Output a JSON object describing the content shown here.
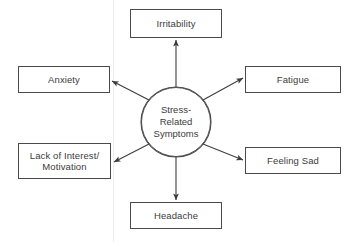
{
  "diagram": {
    "type": "radial-spoke",
    "center": {
      "id": "center",
      "label": "Stress-\nRelated\nSymptoms",
      "shape": "circle",
      "cx": 176,
      "cy": 122,
      "r": 35
    },
    "nodes": [
      {
        "id": "irritability",
        "label": "Irritability",
        "shape": "rect",
        "x": 130,
        "y": 9,
        "w": 92,
        "h": 29,
        "position": "top"
      },
      {
        "id": "fatigue",
        "label": "Fatigue",
        "shape": "rect",
        "x": 245,
        "y": 66,
        "w": 96,
        "h": 27,
        "position": "top-right"
      },
      {
        "id": "feeling-sad",
        "label": "Feeling Sad",
        "shape": "rect",
        "x": 245,
        "y": 147,
        "w": 96,
        "h": 27,
        "position": "bottom-right"
      },
      {
        "id": "headache",
        "label": "Headache",
        "shape": "rect",
        "x": 130,
        "y": 202,
        "w": 92,
        "h": 27,
        "position": "bottom"
      },
      {
        "id": "lack-of-interest",
        "label": "Lack of Interest/\nMotivation",
        "shape": "rect",
        "x": 18,
        "y": 143,
        "w": 93,
        "h": 36,
        "position": "bottom-left"
      },
      {
        "id": "anxiety",
        "label": "Anxiety",
        "shape": "rect",
        "x": 18,
        "y": 66,
        "w": 92,
        "h": 27,
        "position": "top-left"
      }
    ],
    "edges": [
      {
        "from": "center",
        "to": "irritability",
        "x1": 176,
        "y1": 87,
        "x2": 176,
        "y2": 40
      },
      {
        "from": "center",
        "to": "fatigue",
        "x1": 203,
        "y1": 100,
        "x2": 243,
        "y2": 78
      },
      {
        "from": "center",
        "to": "feeling-sad",
        "x1": 203,
        "y1": 144,
        "x2": 243,
        "y2": 160
      },
      {
        "from": "center",
        "to": "headache",
        "x1": 176,
        "y1": 157,
        "x2": 176,
        "y2": 200
      },
      {
        "from": "center",
        "to": "lack-of-interest",
        "x1": 149,
        "y1": 144,
        "x2": 114,
        "y2": 162
      },
      {
        "from": "center",
        "to": "anxiety",
        "x1": 149,
        "y1": 100,
        "x2": 112,
        "y2": 81
      }
    ],
    "style": {
      "stroke_color": "#4a4a4a",
      "text_color": "#3b3b3b",
      "background_color": "#ffffff",
      "arrow_head": "filled-triangle"
    }
  }
}
